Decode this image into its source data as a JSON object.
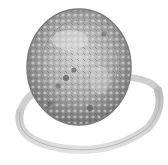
{
  "image": {
    "subject": "ring with large oval pavé halo stone",
    "style": "grayscale product photo",
    "alt": "Ring with large oval pavé-set stone",
    "colors": {
      "background": "#ffffff",
      "band_light": "#d6d6d6",
      "band_dark": "#a8a8a8",
      "stone_base": "#9a9a9a",
      "stone_dark": "#555555",
      "stone_light": "#e2e2e2",
      "outline": "#7a7a7a"
    }
  }
}
